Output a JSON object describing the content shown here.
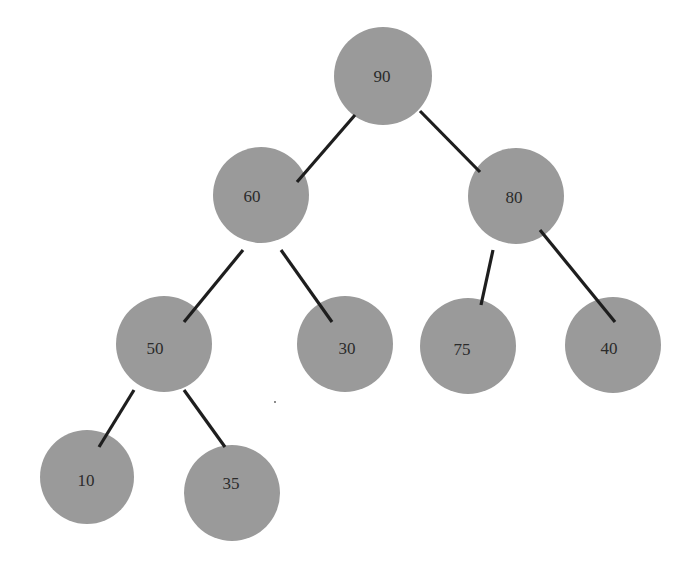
{
  "diagram": {
    "type": "binary-tree (max-heap)",
    "style": {
      "node_fill": "#9a9a9a",
      "edge_color": "#1e1e1e",
      "label_color": "#2b2b2b",
      "background": "#ffffff"
    },
    "nodes": [
      {
        "id": "n90",
        "label": "90",
        "cx": 383,
        "cy": 76,
        "r": 49,
        "tx": 382,
        "ty": 82
      },
      {
        "id": "n60",
        "label": "60",
        "cx": 261,
        "cy": 195,
        "r": 48,
        "tx": 252,
        "ty": 202
      },
      {
        "id": "n80",
        "label": "80",
        "cx": 516,
        "cy": 196,
        "r": 48,
        "tx": 514,
        "ty": 203
      },
      {
        "id": "n50",
        "label": "50",
        "cx": 164,
        "cy": 344,
        "r": 48,
        "tx": 155,
        "ty": 354
      },
      {
        "id": "n30",
        "label": "30",
        "cx": 345,
        "cy": 344,
        "r": 48,
        "tx": 347,
        "ty": 354
      },
      {
        "id": "n75",
        "label": "75",
        "cx": 468,
        "cy": 346,
        "r": 48,
        "tx": 462,
        "ty": 355
      },
      {
        "id": "n40",
        "label": "40",
        "cx": 613,
        "cy": 345,
        "r": 48,
        "tx": 609,
        "ty": 354
      },
      {
        "id": "n10",
        "label": "10",
        "cx": 87,
        "cy": 477,
        "r": 47,
        "tx": 86,
        "ty": 486
      },
      {
        "id": "n35",
        "label": "35",
        "cx": 232,
        "cy": 493,
        "r": 48,
        "tx": 231,
        "ty": 489
      }
    ],
    "edges": [
      {
        "from": "90",
        "to": "60",
        "x1": 355,
        "y1": 115,
        "x2": 297,
        "y2": 182
      },
      {
        "from": "90",
        "to": "80",
        "x1": 420,
        "y1": 111,
        "x2": 480,
        "y2": 172
      },
      {
        "from": "60",
        "to": "50",
        "x1": 243,
        "y1": 250,
        "x2": 184,
        "y2": 322
      },
      {
        "from": "60",
        "to": "30",
        "x1": 281,
        "y1": 250,
        "x2": 332,
        "y2": 322
      },
      {
        "from": "80",
        "to": "75",
        "x1": 493,
        "y1": 250,
        "x2": 481,
        "y2": 305
      },
      {
        "from": "80",
        "to": "40",
        "x1": 540,
        "y1": 230,
        "x2": 615,
        "y2": 322
      },
      {
        "from": "50",
        "to": "10",
        "x1": 134,
        "y1": 390,
        "x2": 99,
        "y2": 447
      },
      {
        "from": "50",
        "to": "35",
        "x1": 184,
        "y1": 390,
        "x2": 225,
        "y2": 447
      }
    ]
  }
}
